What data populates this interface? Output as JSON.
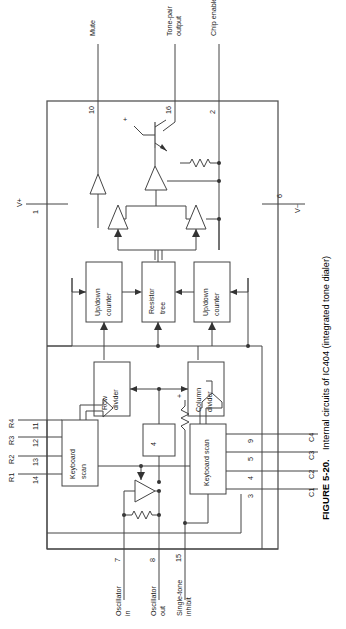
{
  "figure": {
    "number": "FIGURE 5-20.",
    "caption": "Internal circuits of IC404 (integrated tone dialer)"
  },
  "device": {
    "name": "IC404",
    "description": "integrated tone dialer"
  },
  "power_pins": [
    {
      "name": "V+",
      "pin": "1",
      "side": "left"
    },
    {
      "name": "V−",
      "pin": "6",
      "side": "right"
    }
  ],
  "top_signals": [
    {
      "label": "Mute",
      "pin": "10"
    },
    {
      "label": "Tone-pair output",
      "label_line1": "Tone-pair",
      "label_line2": "output",
      "pin": "16"
    },
    {
      "label": "Chip enable",
      "pin": "2"
    }
  ],
  "bottom_signals": [
    {
      "label": "Oscillator in",
      "label_line1": "Oscillator",
      "label_line2": "in",
      "pin": "7"
    },
    {
      "label": "Oscillator out",
      "label_line1": "Oscillator",
      "label_line2": "out",
      "pin": "8"
    },
    {
      "label": "Single-tone inhibit",
      "label_line1": "Single-tone",
      "label_line2": "inhibit",
      "pin": "15"
    }
  ],
  "row_inputs": [
    {
      "label": "R1",
      "pin": "14"
    },
    {
      "label": "R2",
      "pin": "13"
    },
    {
      "label": "R3",
      "pin": "12"
    },
    {
      "label": "R4",
      "pin": "11"
    }
  ],
  "column_inputs": [
    {
      "label": "C1",
      "pin": "3"
    },
    {
      "label": "C2",
      "pin": "4"
    },
    {
      "label": "C3",
      "pin": "5"
    },
    {
      "label": "C4",
      "pin": "9"
    }
  ],
  "blocks": [
    {
      "id": "keyboard-scan-row",
      "line1": "Keyboard",
      "line2": "scan"
    },
    {
      "id": "keyboard-scan-col",
      "line1": "Keyboard scan",
      "line2": ""
    },
    {
      "id": "row-divider",
      "line1": "Row",
      "line2": "divider"
    },
    {
      "id": "column-divider",
      "line1": "Column",
      "line2": "divider"
    },
    {
      "id": "divider-4",
      "line1": "4",
      "line2": ""
    },
    {
      "id": "up-down-counter-left",
      "line1": "Up/down",
      "line2": "counter"
    },
    {
      "id": "resistor-tree",
      "line1": "Resistor",
      "line2": "tree"
    },
    {
      "id": "up-down-counter-right",
      "line1": "Up/down",
      "line2": "counter"
    }
  ],
  "markers": {
    "plus_transistor": "+",
    "plus_inhibit": "+"
  },
  "colors": {
    "line": "#444444",
    "text": "#1a1a1a",
    "background": "#ffffff"
  }
}
